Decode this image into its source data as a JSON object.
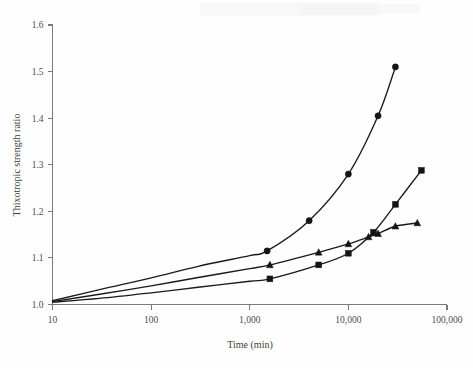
{
  "chart_data": {
    "type": "line",
    "title": "",
    "xlabel": "Time (min)",
    "ylabel": "Thixotropic strength ratio",
    "xscale": "log",
    "yscale": "linear",
    "xlim": [
      10,
      100000
    ],
    "ylim": [
      1.0,
      1.6
    ],
    "grid": false,
    "legend": "none",
    "x_tick_labels": [
      "10",
      "100",
      "1,000",
      "10,000",
      "100,000"
    ],
    "x_tick_values": [
      10,
      100,
      1000,
      10000,
      100000
    ],
    "y_tick_labels": [
      "1.0",
      "1.1",
      "1.2",
      "1.3",
      "1.4",
      "1.5",
      "1.6"
    ],
    "y_tick_values": [
      1.0,
      1.1,
      1.2,
      1.3,
      1.4,
      1.5,
      1.6
    ],
    "series": [
      {
        "name": "circle-series",
        "marker": "circle",
        "x": [
          10,
          30,
          100,
          300,
          1000,
          1500,
          4000,
          10000,
          20000,
          30000
        ],
        "y": [
          1.008,
          1.032,
          1.057,
          1.082,
          1.105,
          1.115,
          1.18,
          1.28,
          1.405,
          1.51
        ]
      },
      {
        "name": "triangle-series",
        "marker": "triangle",
        "x": [
          10,
          30,
          100,
          300,
          1000,
          1600,
          5000,
          10000,
          16000,
          20000,
          30000,
          50000
        ],
        "y": [
          1.006,
          1.022,
          1.04,
          1.058,
          1.077,
          1.085,
          1.112,
          1.13,
          1.145,
          1.152,
          1.168,
          1.175
        ]
      },
      {
        "name": "square-series",
        "marker": "square",
        "x": [
          10,
          30,
          100,
          300,
          1000,
          1600,
          5000,
          10000,
          18000,
          30000,
          55000
        ],
        "y": [
          1.005,
          1.013,
          1.025,
          1.037,
          1.05,
          1.055,
          1.085,
          1.11,
          1.155,
          1.215,
          1.288
        ]
      }
    ]
  },
  "axes": {
    "x_title": "Time (min)",
    "y_title": "Thixotropic strength ratio"
  }
}
